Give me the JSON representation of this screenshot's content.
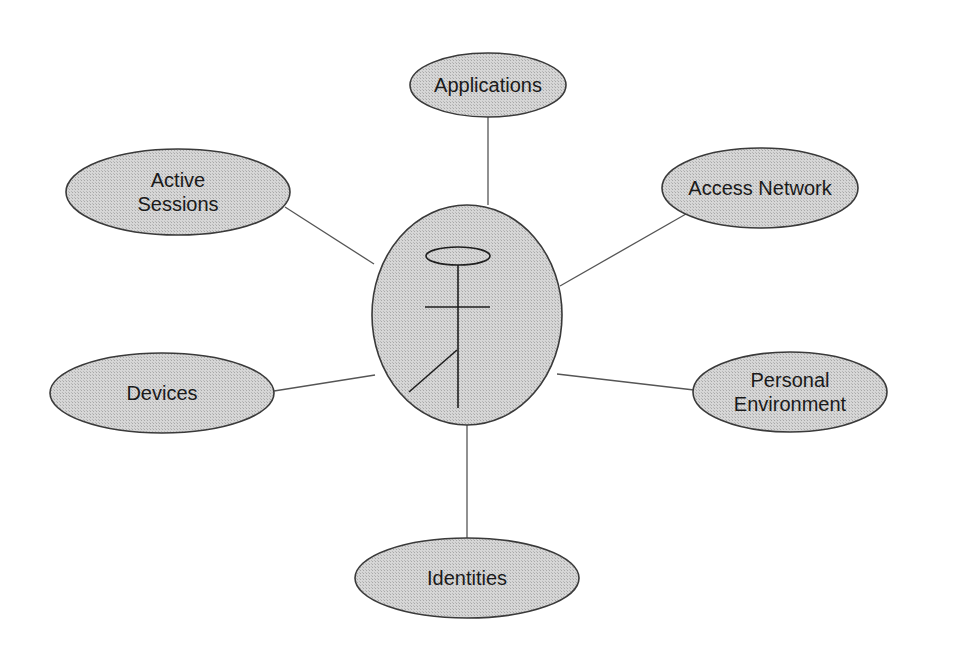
{
  "diagram": {
    "fill_color": "#cfcfcf",
    "stroke_color": "#3a3a3a",
    "center": {
      "label": "",
      "icon": "stick-figure-with-halo-icon",
      "cx": 467,
      "cy": 315,
      "rx": 95,
      "ry": 110
    },
    "nodes": [
      {
        "id": "applications",
        "lines": [
          "Applications"
        ],
        "cx": 488,
        "cy": 85,
        "rx": 78,
        "ry": 32
      },
      {
        "id": "active-sessions",
        "lines": [
          "Active",
          "Sessions"
        ],
        "cx": 178,
        "cy": 192,
        "rx": 112,
        "ry": 43
      },
      {
        "id": "access-network",
        "lines": [
          "Access Network"
        ],
        "cx": 760,
        "cy": 188,
        "rx": 98,
        "ry": 40
      },
      {
        "id": "devices",
        "lines": [
          "Devices"
        ],
        "cx": 162,
        "cy": 393,
        "rx": 112,
        "ry": 40
      },
      {
        "id": "personal-environment",
        "lines": [
          "Personal",
          "Environment"
        ],
        "cx": 790,
        "cy": 392,
        "rx": 97,
        "ry": 40
      },
      {
        "id": "identities",
        "lines": [
          "Identities"
        ],
        "cx": 467,
        "cy": 578,
        "rx": 112,
        "ry": 40
      }
    ],
    "edges": [
      {
        "from": "center",
        "to": "applications",
        "x1": 488,
        "y1": 205,
        "x2": 488,
        "y2": 117
      },
      {
        "from": "center",
        "to": "active-sessions",
        "x1": 374,
        "y1": 264,
        "x2": 285,
        "y2": 207
      },
      {
        "from": "center",
        "to": "access-network",
        "x1": 560,
        "y1": 286,
        "x2": 686,
        "y2": 214
      },
      {
        "from": "center",
        "to": "devices",
        "x1": 375,
        "y1": 375,
        "x2": 274,
        "y2": 391
      },
      {
        "from": "center",
        "to": "personal-environment",
        "x1": 557,
        "y1": 374,
        "x2": 694,
        "y2": 390
      },
      {
        "from": "center",
        "to": "identities",
        "x1": 467,
        "y1": 425,
        "x2": 467,
        "y2": 538
      }
    ]
  }
}
